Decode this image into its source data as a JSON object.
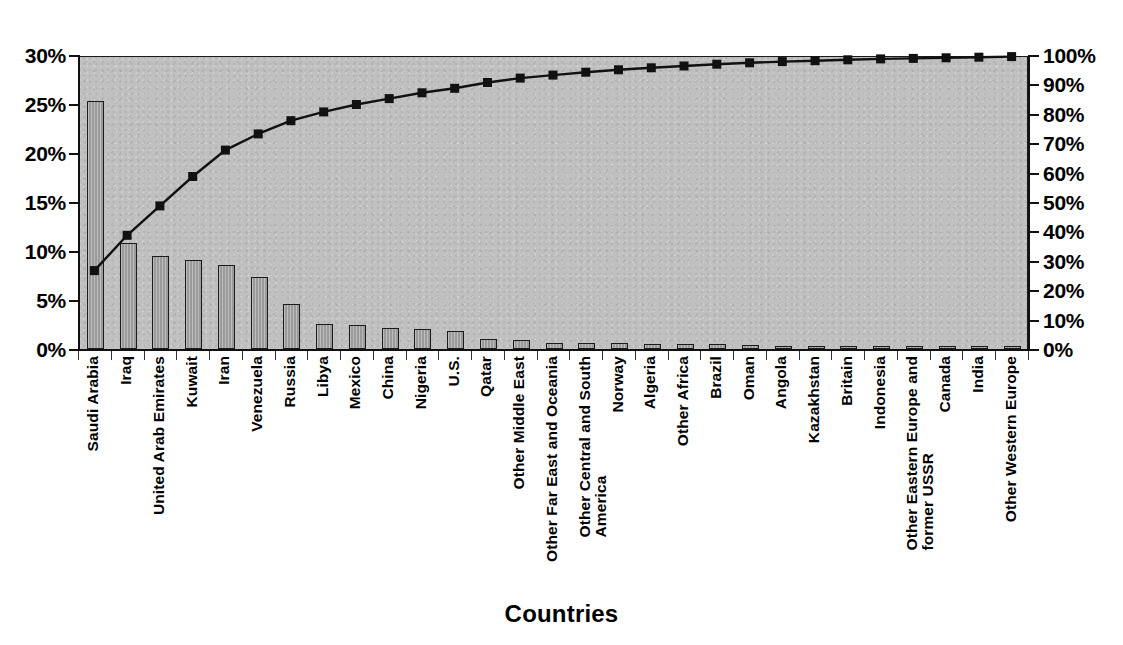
{
  "chart_data": {
    "type": "bar",
    "title": "",
    "xlabel": "Countries",
    "ylabel": "",
    "ylabel_right": "",
    "ylim": [
      0,
      30
    ],
    "ylim_right": [
      0,
      100
    ],
    "grid": false,
    "legend": null,
    "left_axis_ticks": [
      "0%",
      "5%",
      "10%",
      "15%",
      "20%",
      "25%",
      "30%"
    ],
    "left_axis_tick_values": [
      0,
      5,
      10,
      15,
      20,
      25,
      30
    ],
    "right_axis_ticks": [
      "0%",
      "10%",
      "20%",
      "30%",
      "40%",
      "50%",
      "60%",
      "70%",
      "80%",
      "90%",
      "100%"
    ],
    "right_axis_tick_values": [
      0,
      10,
      20,
      30,
      40,
      50,
      60,
      70,
      80,
      90,
      100
    ],
    "categories": [
      "Saudi Arabia",
      "Iraq",
      "United Arab Emirates",
      "Kuwait",
      "Iran",
      "Venezuela",
      "Russia",
      "Libya",
      "Mexico",
      "China",
      "Nigeria",
      "U.S.",
      "Qatar",
      "Other Middle East",
      "Other Far East and Oceania",
      "Other Central and South America",
      "Norway",
      "Algeria",
      "Other Africa",
      "Brazil",
      "Oman",
      "Angola",
      "Kazakhstan",
      "Britain",
      "Indonesia",
      "Other Eastern Europe and former USSR",
      "Canada",
      "India",
      "Other Western Europe"
    ],
    "category_lines": [
      [
        "Saudi Arabia"
      ],
      [
        "Iraq"
      ],
      [
        "United Arab Emirates"
      ],
      [
        "Kuwait"
      ],
      [
        "Iran"
      ],
      [
        "Venezuela"
      ],
      [
        "Russia"
      ],
      [
        "Libya"
      ],
      [
        "Mexico"
      ],
      [
        "China"
      ],
      [
        "Nigeria"
      ],
      [
        "U.S."
      ],
      [
        "Qatar"
      ],
      [
        "Other Middle East"
      ],
      [
        "Other Far East and Oceania"
      ],
      [
        "Other Central and South",
        "America"
      ],
      [
        "Norway"
      ],
      [
        "Algeria"
      ],
      [
        "Other Africa"
      ],
      [
        "Brazil"
      ],
      [
        "Oman"
      ],
      [
        "Angola"
      ],
      [
        "Kazakhstan"
      ],
      [
        "Britain"
      ],
      [
        "Indonesia"
      ],
      [
        "Other Eastern Europe and",
        "former USSR"
      ],
      [
        "Canada"
      ],
      [
        "India"
      ],
      [
        "Other Western Europe"
      ]
    ],
    "series": [
      {
        "name": "Share of reserves",
        "axis": "left",
        "render": "bar",
        "unit": "%",
        "values": [
          25.3,
          10.8,
          9.5,
          9.1,
          8.6,
          7.3,
          4.6,
          2.6,
          2.5,
          2.1,
          2.0,
          1.8,
          1.0,
          0.95,
          0.6,
          0.6,
          0.6,
          0.55,
          0.5,
          0.5,
          0.4,
          0.35,
          0.3,
          0.3,
          0.3,
          0.25,
          0.2,
          0.2,
          0.15
        ]
      },
      {
        "name": "Cumulative percentage",
        "axis": "right",
        "render": "line",
        "unit": "%",
        "marker": "square",
        "values": [
          27.0,
          39.0,
          49.0,
          59.0,
          68.0,
          73.5,
          78.0,
          81.0,
          83.5,
          85.5,
          87.5,
          89.0,
          91.0,
          92.5,
          93.5,
          94.5,
          95.3,
          96.0,
          96.6,
          97.2,
          97.7,
          98.1,
          98.4,
          98.7,
          99.0,
          99.2,
          99.4,
          99.6,
          99.8
        ]
      }
    ],
    "colors": {
      "plot_background": "#c0c0c0",
      "bar_fill": "#9a9a9a",
      "bar_stroke": "#1b1b1b",
      "line": "#111111",
      "marker": "#111111",
      "axis": "#111111",
      "text": "#000000"
    }
  }
}
